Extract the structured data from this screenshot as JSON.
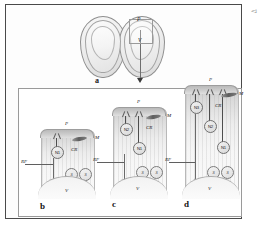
{
  "figure": {
    "caption_mark": "◅",
    "panels": [
      "a",
      "b",
      "c",
      "d"
    ]
  },
  "panel_a": {
    "letter": "a",
    "labels": {
      "P": "P",
      "V": "V"
    },
    "inset_note": "P",
    "arrow": "down-arrow"
  },
  "legend_terms": {
    "P": "P",
    "M": "M",
    "CR": "CR",
    "RF": "RF",
    "V": "V",
    "S": "S",
    "N1": "N1",
    "N2": "N2",
    "N3": "N3"
  },
  "panel_b": {
    "letter": "b",
    "top_label": "P",
    "m_label": "M",
    "cr_label": "CR",
    "rf_label": "RF",
    "v_label": "V",
    "somas": [
      {
        "name": "N1"
      }
    ],
    "s_cells": [
      "S",
      "S"
    ]
  },
  "panel_c": {
    "letter": "c",
    "top_label": "P",
    "m_label": "M",
    "cr_label": "CR",
    "rf_label": "RF",
    "v_label": "V",
    "somas": [
      {
        "name": "N2"
      },
      {
        "name": "N1"
      }
    ],
    "s_cells": [
      "S",
      "S"
    ]
  },
  "panel_d": {
    "letter": "d",
    "top_label": "P",
    "m_label": "M",
    "cr_label": "CR",
    "rf_label": "RF",
    "v_label": "V",
    "somas": [
      {
        "name": "N3"
      },
      {
        "name": "N2"
      },
      {
        "name": "N1"
      }
    ],
    "s_cells": [
      "S",
      "S"
    ]
  }
}
